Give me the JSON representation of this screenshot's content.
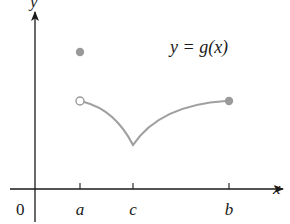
{
  "figure": {
    "function_label": "y = g(x)",
    "axes": {
      "x_label": "x",
      "y_label": "y",
      "origin_label": "0"
    },
    "ticks": [
      {
        "label": "a",
        "px": 80
      },
      {
        "label": "c",
        "px": 133
      },
      {
        "label": "b",
        "px": 229
      }
    ],
    "points": {
      "filled_at_a": {
        "px": 80,
        "py": 52,
        "type": "filled"
      },
      "open_at_a": {
        "px": 80,
        "py": 101,
        "type": "open"
      },
      "cusp_at_c": {
        "px": 133,
        "py": 145
      },
      "filled_at_b": {
        "px": 229,
        "py": 101,
        "type": "filled"
      }
    },
    "colors": {
      "axis": "#1a1a1a",
      "curve": "#a0a0a0",
      "point_fill": "#9a9a9a",
      "text": "#1a1a1a"
    }
  }
}
